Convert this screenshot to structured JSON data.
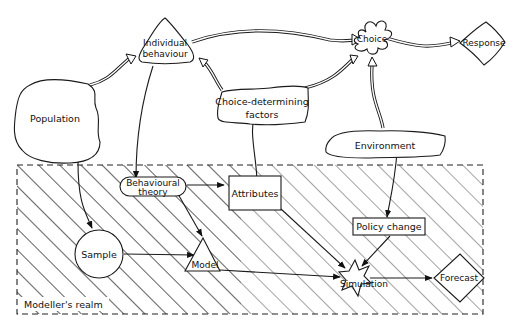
{
  "diagram": {
    "realm_label": "Modeller's realm",
    "nodes": {
      "individual_behaviour": {
        "line1": "Individual",
        "line2": "behaviour"
      },
      "choice": {
        "label": "Choice"
      },
      "response": {
        "label": "Response"
      },
      "population": {
        "label": "Population"
      },
      "choice_determining_factors": {
        "line1": "Choice-determining",
        "line2": "factors"
      },
      "environment": {
        "label": "Environment"
      },
      "behavioural_theory": {
        "line1": "Behavioural",
        "line2": "theory"
      },
      "attributes": {
        "label": "Attributes"
      },
      "policy_change": {
        "label": "Policy change"
      },
      "sample": {
        "label": "Sample"
      },
      "model": {
        "label": "Model"
      },
      "simulation": {
        "label": "Simulation"
      },
      "forecast": {
        "label": "Forecast"
      }
    },
    "edges": [
      {
        "from": "Population",
        "to": "Individual behaviour",
        "style": "double"
      },
      {
        "from": "Individual behaviour",
        "to": "Choice",
        "style": "double"
      },
      {
        "from": "Choice",
        "to": "Response",
        "style": "double"
      },
      {
        "from": "Choice-determining factors",
        "to": "Individual behaviour",
        "style": "double"
      },
      {
        "from": "Choice-determining factors",
        "to": "Choice",
        "style": "double"
      },
      {
        "from": "Environment",
        "to": "Choice",
        "style": "double"
      },
      {
        "from": "Individual behaviour",
        "to": "Behavioural theory",
        "style": "single"
      },
      {
        "from": "Population",
        "to": "Sample",
        "style": "single"
      },
      {
        "from": "Choice-determining factors",
        "to": "Attributes",
        "style": "single"
      },
      {
        "from": "Environment",
        "to": "Policy change",
        "style": "single"
      },
      {
        "from": "Behavioural theory",
        "to": "Attributes",
        "style": "single"
      },
      {
        "from": "Behavioural theory",
        "to": "Model",
        "style": "single"
      },
      {
        "from": "Sample",
        "to": "Model",
        "style": "single"
      },
      {
        "from": "Model",
        "to": "Simulation",
        "style": "single"
      },
      {
        "from": "Attributes",
        "to": "Simulation",
        "style": "single"
      },
      {
        "from": "Policy change",
        "to": "Simulation",
        "style": "single"
      },
      {
        "from": "Simulation",
        "to": "Forecast",
        "style": "single"
      }
    ]
  }
}
